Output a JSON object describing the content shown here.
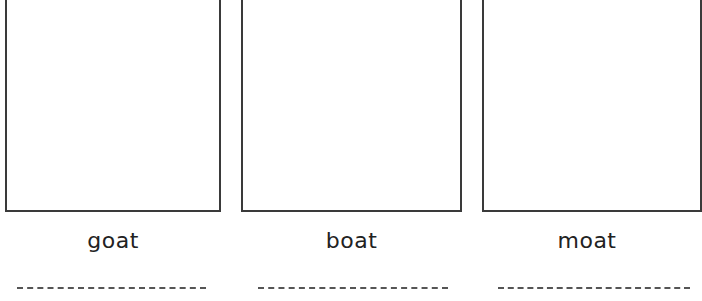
{
  "worksheet": {
    "cards": [
      {
        "word": "goat",
        "image_box": "empty-drawing-box",
        "writing_line": "dashed"
      },
      {
        "word": "boat",
        "image_box": "empty-drawing-box",
        "writing_line": "dashed"
      },
      {
        "word": "moat",
        "image_box": "empty-drawing-box",
        "writing_line": "dashed"
      }
    ]
  },
  "colors": {
    "border": "#3a3a3a",
    "text": "#222222",
    "dashed_line": "#555555",
    "background": "#ffffff"
  }
}
